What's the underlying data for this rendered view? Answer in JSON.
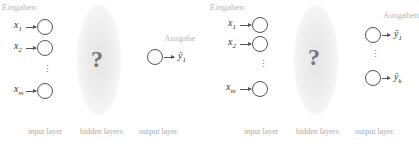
{
  "left_panel": {
    "inputs_label": "Eingaben",
    "outputs_label": "Ausgabe",
    "inputs": [
      {
        "name": "x",
        "sub": "1"
      },
      {
        "name": "x",
        "sub": "2"
      },
      {
        "name": "x",
        "sub": "m"
      }
    ],
    "outputs": [
      {
        "name": "ŷ",
        "sub": "1"
      }
    ],
    "vertical_ellipsis": "⋮",
    "hidden_symbol": "?",
    "layer_labels": [
      "input layer",
      "hidden layers",
      "output layer"
    ]
  },
  "right_panel": {
    "inputs_label": "Eingaben",
    "outputs_label": "Ausgaben",
    "inputs": [
      {
        "name": "x",
        "sub": "1"
      },
      {
        "name": "x",
        "sub": "2"
      },
      {
        "name": "x",
        "sub": "m"
      }
    ],
    "outputs": [
      {
        "name": "ŷ",
        "sub": "1"
      },
      {
        "name": "ŷ",
        "sub": "k"
      }
    ],
    "vertical_ellipsis": "⋮",
    "hidden_symbol": "?",
    "layer_labels": [
      "input layer",
      "hidden layers",
      "output layer"
    ]
  }
}
